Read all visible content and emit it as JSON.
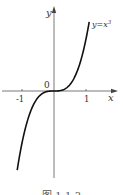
{
  "chart_data": {
    "type": "line",
    "title": "",
    "function": "y=x³",
    "series": [
      {
        "name": "y=x³",
        "x": [
          -1.15,
          -1.0,
          -0.8,
          -0.6,
          -0.4,
          -0.2,
          0,
          0.2,
          0.4,
          0.6,
          0.8,
          1.0,
          1.1
        ],
        "y": [
          -1.52,
          -1.0,
          -0.512,
          -0.216,
          -0.064,
          -0.008,
          0,
          0.008,
          0.064,
          0.216,
          0.512,
          1.0,
          1.331
        ]
      }
    ],
    "xlabel": "x",
    "ylabel": "y",
    "x_ticks": [
      "-1",
      "1"
    ],
    "origin_label": "0",
    "curve_label": "y=x³",
    "grid": false,
    "legend": "none"
  },
  "labels": {
    "y_axis": "y",
    "x_axis": "x",
    "origin": "0",
    "tick_neg1": "-1",
    "tick_pos1": "1",
    "curve": "y=x",
    "curve_exp": "3"
  },
  "caption": "图 1-1-3"
}
